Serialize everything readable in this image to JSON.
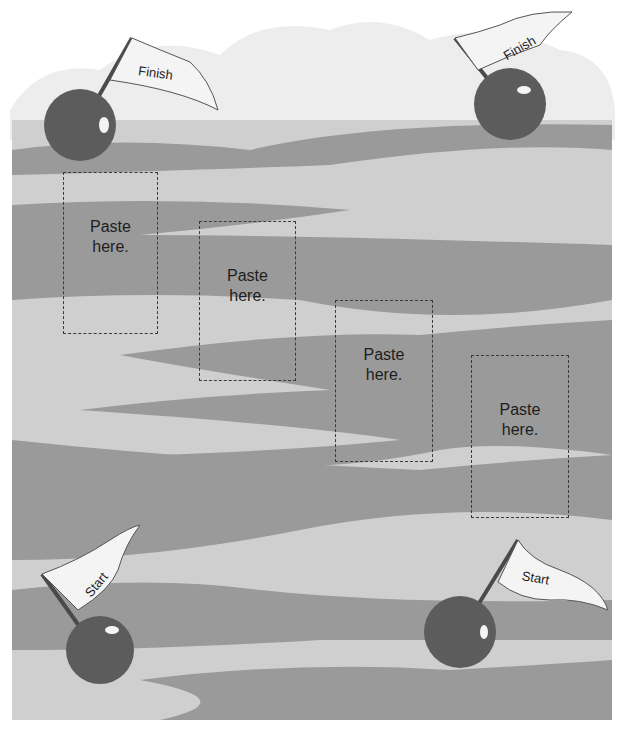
{
  "worksheet": {
    "colors": {
      "background": "#ffffff",
      "sky_cloud": "#e9e9e9",
      "water_dark": "#9a9a9a",
      "water_light": "#cfcfcf",
      "buoy": "#5c5c5c",
      "flag": "#f4f4f4",
      "dashed_border": "#3a3a3a"
    },
    "flags": [
      {
        "id": "finish-left",
        "label": "Finish"
      },
      {
        "id": "finish-right",
        "label": "Finish"
      },
      {
        "id": "start-left",
        "label": "Start"
      },
      {
        "id": "start-right",
        "label": "Start"
      }
    ],
    "paste_boxes": [
      {
        "line1": "Paste",
        "line2": "here."
      },
      {
        "line1": "Paste",
        "line2": "here."
      },
      {
        "line1": "Paste",
        "line2": "here."
      },
      {
        "line1": "Paste",
        "line2": "here."
      }
    ]
  }
}
